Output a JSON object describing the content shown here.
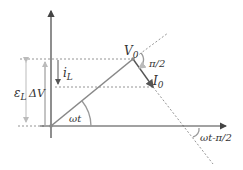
{
  "diagram": {
    "type": "phasor-diagram",
    "labels": {
      "v0": "V",
      "v0_sub": "0",
      "i0": "I",
      "i0_sub": "0",
      "angle_pi2": "π/2",
      "omega_t": "ωt",
      "omega_t_minus": "ωt-π/2",
      "i_l": "i",
      "i_l_sub": "L",
      "epsilon_l": "ε",
      "epsilon_l_sub": "L",
      "delta_v": "ΔV"
    },
    "colors": {
      "axis": "#444444",
      "phasor": "#888888",
      "dashed": "#888888",
      "arrow_light": "#bbbbbb",
      "arrow_dark": "#555555",
      "text": "#333333"
    }
  }
}
